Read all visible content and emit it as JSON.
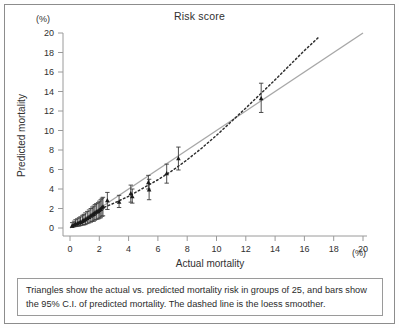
{
  "figure": {
    "title": "Risk score",
    "caption": "Triangles show the actual vs. predicted mortality risk in groups of 25, and bars show the 95% C.I. of predicted mortality. The dashed line is the loess smoother.",
    "border_color": "#8c8c8c",
    "background": "#ffffff"
  },
  "axes": {
    "y_unit": "(%)",
    "x_unit": "(%)",
    "y_title": "Predicted mortality",
    "x_title": "Actual mortality"
  },
  "chart_data": {
    "type": "scatter",
    "title": "Risk score",
    "xlabel": "Actual mortality",
    "ylabel": "Predicted mortality",
    "xunit": "(%)",
    "yunit": "(%)",
    "xlim": [
      0,
      20
    ],
    "ylim": [
      0,
      20
    ],
    "xticks": [
      0,
      2,
      4,
      6,
      8,
      10,
      12,
      14,
      16,
      18,
      20
    ],
    "yticks": [
      0,
      2,
      4,
      6,
      8,
      10,
      12,
      14,
      16,
      18,
      20
    ],
    "grid": false,
    "legend": "none",
    "marker_color": "#1a1a1a",
    "errorbar_color": "#3a3a3a",
    "identity_line_color": "#a8a8a8",
    "loess_line_color": "#2f2f2f",
    "series": [
      {
        "name": "Actual vs predicted mortality (groups of 25)",
        "marker": "triangle",
        "points": [
          {
            "x": 0.15,
            "y": 0.25,
            "lo": 0.05,
            "hi": 0.55
          },
          {
            "x": 0.28,
            "y": 0.35,
            "lo": 0.12,
            "hi": 0.7
          },
          {
            "x": 0.38,
            "y": 0.42,
            "lo": 0.15,
            "hi": 0.85
          },
          {
            "x": 0.5,
            "y": 0.48,
            "lo": 0.18,
            "hi": 0.95
          },
          {
            "x": 0.62,
            "y": 0.55,
            "lo": 0.2,
            "hi": 1.05
          },
          {
            "x": 0.72,
            "y": 0.62,
            "lo": 0.25,
            "hi": 1.15
          },
          {
            "x": 0.85,
            "y": 0.72,
            "lo": 0.3,
            "hi": 1.3
          },
          {
            "x": 0.95,
            "y": 0.8,
            "lo": 0.32,
            "hi": 1.4
          },
          {
            "x": 1.05,
            "y": 0.88,
            "lo": 0.35,
            "hi": 1.55
          },
          {
            "x": 1.18,
            "y": 1.0,
            "lo": 0.45,
            "hi": 1.7
          },
          {
            "x": 1.3,
            "y": 1.12,
            "lo": 0.52,
            "hi": 1.85
          },
          {
            "x": 1.42,
            "y": 1.25,
            "lo": 0.6,
            "hi": 2.0
          },
          {
            "x": 1.52,
            "y": 1.35,
            "lo": 0.68,
            "hi": 2.15
          },
          {
            "x": 1.62,
            "y": 1.42,
            "lo": 0.7,
            "hi": 2.25
          },
          {
            "x": 1.7,
            "y": 1.55,
            "lo": 0.8,
            "hi": 2.4
          },
          {
            "x": 1.8,
            "y": 1.65,
            "lo": 0.88,
            "hi": 2.5
          },
          {
            "x": 1.92,
            "y": 1.72,
            "lo": 0.92,
            "hi": 2.6
          },
          {
            "x": 2.0,
            "y": 1.85,
            "lo": 1.0,
            "hi": 2.75
          },
          {
            "x": 2.1,
            "y": 1.95,
            "lo": 1.05,
            "hi": 2.9
          },
          {
            "x": 2.18,
            "y": 2.1,
            "lo": 1.2,
            "hi": 3.05
          },
          {
            "x": 2.25,
            "y": 2.2,
            "lo": 1.25,
            "hi": 3.15
          },
          {
            "x": 2.55,
            "y": 2.85,
            "lo": 1.9,
            "hi": 3.65
          },
          {
            "x": 3.35,
            "y": 2.7,
            "lo": 2.1,
            "hi": 3.35
          },
          {
            "x": 4.15,
            "y": 3.55,
            "lo": 2.65,
            "hi": 4.4
          },
          {
            "x": 4.25,
            "y": 3.25,
            "lo": 2.55,
            "hi": 4.0
          },
          {
            "x": 5.35,
            "y": 4.7,
            "lo": 4.0,
            "hi": 5.4
          },
          {
            "x": 5.4,
            "y": 3.95,
            "lo": 2.9,
            "hi": 5.0
          },
          {
            "x": 6.6,
            "y": 5.6,
            "lo": 4.6,
            "hi": 6.55
          },
          {
            "x": 7.4,
            "y": 7.15,
            "lo": 5.95,
            "hi": 8.3
          },
          {
            "x": 13.05,
            "y": 13.3,
            "lo": 11.85,
            "hi": 14.85
          }
        ]
      }
    ],
    "reference_lines": [
      {
        "name": "identity-line",
        "style": "solid",
        "color": "#a8a8a8",
        "from": {
          "x": 0.0,
          "y": 0.0
        },
        "to": {
          "x": 20.0,
          "y": 20.0
        }
      },
      {
        "name": "loess-smoother",
        "style": "dashed",
        "color": "#2f2f2f",
        "points": [
          {
            "x": 0.15,
            "y": 0.1
          },
          {
            "x": 1.0,
            "y": 0.85
          },
          {
            "x": 2.0,
            "y": 1.9
          },
          {
            "x": 3.0,
            "y": 2.55
          },
          {
            "x": 4.0,
            "y": 3.25
          },
          {
            "x": 5.0,
            "y": 4.1
          },
          {
            "x": 6.0,
            "y": 4.95
          },
          {
            "x": 7.0,
            "y": 5.9
          },
          {
            "x": 8.0,
            "y": 7.0
          },
          {
            "x": 9.0,
            "y": 8.2
          },
          {
            "x": 10.0,
            "y": 9.5
          },
          {
            "x": 11.0,
            "y": 10.9
          },
          {
            "x": 12.0,
            "y": 12.3
          },
          {
            "x": 13.0,
            "y": 13.75
          },
          {
            "x": 14.0,
            "y": 15.2
          },
          {
            "x": 15.0,
            "y": 16.7
          },
          {
            "x": 16.0,
            "y": 18.2
          },
          {
            "x": 17.0,
            "y": 19.6
          }
        ]
      }
    ]
  }
}
